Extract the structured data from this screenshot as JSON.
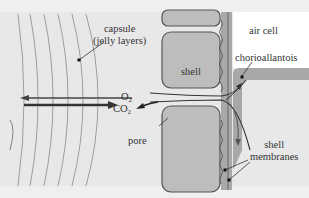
{
  "diagram": {
    "labels": {
      "capsule_line1": "capsule",
      "capsule_line2": "(jelly layers)",
      "shell": "shell",
      "air_cell": "air cell",
      "chorioallantois": "chorioallantois",
      "o2_base": "O",
      "o2_sub": "2",
      "co2_base": "CO",
      "co2_sub": "2",
      "pore": "pore",
      "shell_membranes_line1": "shell",
      "shell_membranes_line2": "membranes"
    },
    "colors": {
      "background": "#e9e9e9",
      "capsule": "#e3e3e3",
      "shell_fill": "#b9b9b9",
      "shell_outline": "#555555",
      "membrane": "#9a9a9a",
      "air_cell": "#ffffff",
      "chorioallantois": "#a8a8a8",
      "arrow": "#444444"
    }
  }
}
